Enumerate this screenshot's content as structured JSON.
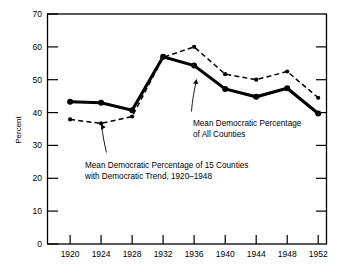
{
  "chart_data": {
    "type": "line",
    "title": "",
    "xlabel": "",
    "ylabel": "Percent",
    "categories": [
      "1920",
      "1924",
      "1928",
      "1932",
      "1936",
      "1940",
      "1944",
      "1948",
      "1952"
    ],
    "x": [
      1920,
      1924,
      1928,
      1932,
      1936,
      1940,
      1944,
      1948,
      1952
    ],
    "xlim": [
      1918,
      1954
    ],
    "ylim": [
      0,
      70
    ],
    "yticks": [
      0,
      10,
      20,
      30,
      40,
      50,
      60,
      70
    ],
    "ytick_labels": [
      "0",
      "10",
      "20",
      "30",
      "40",
      "50",
      "60",
      "70"
    ],
    "grid": false,
    "legend": "none",
    "series": [
      {
        "name": "Mean Democratic Percentage of All Counties",
        "style": "solid",
        "values": [
          43.3,
          43.0,
          40.7,
          57.0,
          54.3,
          47.2,
          44.8,
          47.4,
          39.7
        ]
      },
      {
        "name": "Mean Democratic Percentage of 15 Counties with Democratic Trend, 1920-1948",
        "style": "dashed",
        "values": [
          37.9,
          36.7,
          38.8,
          56.8,
          60.0,
          51.7,
          50.0,
          52.5,
          44.5
        ]
      }
    ],
    "annotations": [
      {
        "id": "all-counties",
        "line1": "Mean Democratic Percentage",
        "line2": "of All Counties"
      },
      {
        "id": "fifteen-counties",
        "line1": "Mean Democratic Percentage of 15 Counties",
        "line2": "with Democratic Trend, 1920–1948"
      }
    ],
    "colors": {
      "axis": "#000000",
      "series_solid": "#000000",
      "series_dashed": "#000000",
      "background": "#ffffff"
    }
  }
}
